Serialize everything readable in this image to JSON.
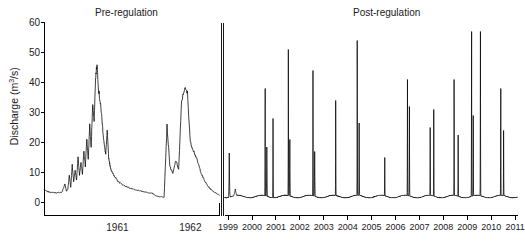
{
  "chart_data": {
    "type": "line",
    "title": "",
    "ylabel": "Discharge (m3/s)",
    "ylabel_main": "Discharge (m",
    "ylabel_sup": "3",
    "ylabel_tail": "/s)",
    "xlabel": "",
    "ylim": [
      0,
      60
    ],
    "yticks": [
      0,
      10,
      20,
      30,
      40,
      50,
      60
    ],
    "grid": false,
    "legend": "none",
    "panels": [
      {
        "name": "pre-regulation",
        "title": "Pre-regulation",
        "xlabel": "",
        "xticks": [
          1961,
          1962
        ],
        "xtick_labels": [
          "1961",
          "1962"
        ],
        "xlim": [
          1960.5,
          1962.9
        ],
        "description": "Continuous natural hydrograph with broad snowmelt freshet peaks",
        "series": [
          {
            "name": "Discharge",
            "x": [
              1960.5,
              1960.54,
              1960.58,
              1960.62,
              1960.66,
              1960.7,
              1960.74,
              1960.78,
              1960.8,
              1960.82,
              1960.84,
              1960.86,
              1960.88,
              1960.9,
              1960.92,
              1960.94,
              1960.96,
              1960.98,
              1961.0,
              1961.02,
              1961.04,
              1961.06,
              1961.08,
              1961.1,
              1961.12,
              1961.14,
              1961.16,
              1961.18,
              1961.2,
              1961.22,
              1961.24,
              1961.26,
              1961.28,
              1961.3,
              1961.32,
              1961.34,
              1961.36,
              1961.38,
              1961.4,
              1961.42,
              1961.44,
              1961.46,
              1961.48,
              1961.5,
              1961.54,
              1961.58,
              1961.62,
              1961.66,
              1961.7,
              1961.74,
              1961.78,
              1961.82,
              1961.86,
              1961.9,
              1961.94,
              1961.98,
              1962.02,
              1962.06,
              1962.1,
              1962.14,
              1962.18,
              1962.22,
              1962.26,
              1962.3,
              1962.34,
              1962.38,
              1962.42,
              1962.46,
              1962.5,
              1962.54,
              1962.58,
              1962.62,
              1962.66,
              1962.7,
              1962.74,
              1962.78,
              1962.82,
              1962.86,
              1962.9
            ],
            "values": [
              4.2,
              3.6,
              3.4,
              3.3,
              3.2,
              3.3,
              3.4,
              6.2,
              3.8,
              4.5,
              9.0,
              5.0,
              12.5,
              7.0,
              10.5,
              7.5,
              15.0,
              9.0,
              13.0,
              9.5,
              17.0,
              12.0,
              21.5,
              14.0,
              26.0,
              18.0,
              33.0,
              27.0,
              41.0,
              46.5,
              38.0,
              34.0,
              30.0,
              24.0,
              19.0,
              16.0,
              23.5,
              15.0,
              12.0,
              10.5,
              9.5,
              8.8,
              8.0,
              7.2,
              6.4,
              5.8,
              5.3,
              4.9,
              4.5,
              4.2,
              4.0,
              3.8,
              3.6,
              3.4,
              3.2,
              3.0,
              2.4,
              2.0,
              1.9,
              1.8,
              25.5,
              12.0,
              9.5,
              14.0,
              11.0,
              33.5,
              38.0,
              36.5,
              20.0,
              17.5,
              15.0,
              12.0,
              9.0,
              7.0,
              5.5,
              4.4,
              3.6,
              3.0,
              2.4
            ]
          }
        ]
      },
      {
        "name": "post-regulation",
        "title": "Post-regulation",
        "xlabel": "",
        "xticks": [
          1999,
          2000,
          2001,
          2002,
          2003,
          2004,
          2005,
          2006,
          2007,
          2008,
          2009,
          2010,
          2011
        ],
        "xtick_labels": [
          "1999",
          "2000",
          "2001",
          "2002",
          "2003",
          "2004",
          "2005",
          "2006",
          "2007",
          "2008",
          "2009",
          "2010",
          "2011"
        ],
        "xlim": [
          1998.85,
          2011.1
        ],
        "description": "Regulated flow: low stable baseflow near 2 m3/s punctuated by brief annual controlled-release spikes",
        "baseflow": 2.0,
        "spikes": [
          {
            "year": 1999.05,
            "peak": 16.5,
            "width": 0.035
          },
          {
            "year": 1999.3,
            "peak": 4.5,
            "width": 0.12
          },
          {
            "year": 2000.55,
            "peak": 38.0,
            "width": 0.02
          },
          {
            "year": 2000.62,
            "peak": 18.5,
            "width": 0.03
          },
          {
            "year": 2000.88,
            "peak": 28.0,
            "width": 0.02
          },
          {
            "year": 2001.52,
            "peak": 51.0,
            "width": 0.018
          },
          {
            "year": 2001.58,
            "peak": 21.0,
            "width": 0.028
          },
          {
            "year": 2002.55,
            "peak": 44.0,
            "width": 0.018
          },
          {
            "year": 2002.62,
            "peak": 17.0,
            "width": 0.028
          },
          {
            "year": 2003.5,
            "peak": 34.0,
            "width": 0.018
          },
          {
            "year": 2004.4,
            "peak": 54.0,
            "width": 0.018
          },
          {
            "year": 2004.48,
            "peak": 26.5,
            "width": 0.022
          },
          {
            "year": 2005.55,
            "peak": 15.0,
            "width": 0.02
          },
          {
            "year": 2006.5,
            "peak": 41.0,
            "width": 0.018
          },
          {
            "year": 2006.58,
            "peak": 32.0,
            "width": 0.02
          },
          {
            "year": 2007.45,
            "peak": 25.0,
            "width": 0.018
          },
          {
            "year": 2007.6,
            "peak": 31.0,
            "width": 0.018
          },
          {
            "year": 2008.45,
            "peak": 41.0,
            "width": 0.018
          },
          {
            "year": 2008.62,
            "peak": 22.5,
            "width": 0.018
          },
          {
            "year": 2009.18,
            "peak": 57.0,
            "width": 0.018
          },
          {
            "year": 2009.25,
            "peak": 29.0,
            "width": 0.018
          },
          {
            "year": 2009.55,
            "peak": 57.0,
            "width": 0.018
          },
          {
            "year": 2010.4,
            "peak": 38.0,
            "width": 0.018
          },
          {
            "year": 2010.52,
            "peak": 24.0,
            "width": 0.018
          }
        ]
      }
    ]
  },
  "axes": {
    "y_axis_name": "discharge-axis",
    "x_axis_pre_name": "year-axis-pre",
    "x_axis_post_name": "year-axis-post"
  }
}
